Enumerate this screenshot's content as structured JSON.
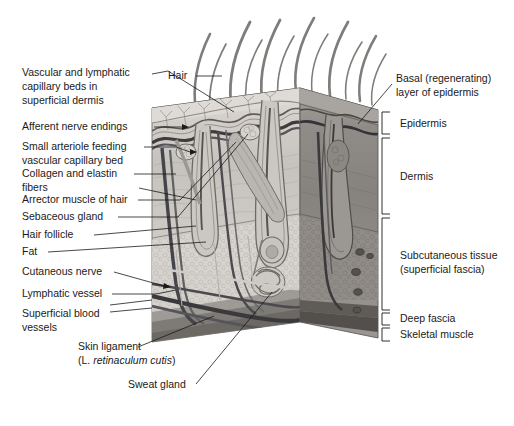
{
  "figure": {
    "background": "#ffffff",
    "ink": "#1a1a1a"
  },
  "left_labels": [
    {
      "id": "vascular-lymphatic",
      "lines": [
        "Vascular and lymphatic",
        "capillary beds in",
        "superficial dermis"
      ],
      "x": 22,
      "y": 76
    },
    {
      "id": "afferent-nerve-endings",
      "lines": [
        "Afferent nerve endings"
      ],
      "x": 22,
      "y": 130
    },
    {
      "id": "small-arteriole",
      "lines": [
        "Small arteriole feeding",
        "vascular capillary bed"
      ],
      "x": 22,
      "y": 150
    },
    {
      "id": "collagen-elastin",
      "lines": [
        "Collagen and elastin",
        "fibers"
      ],
      "x": 22,
      "y": 177
    },
    {
      "id": "arrector-muscle",
      "lines": [
        "Arrector muscle of hair"
      ],
      "x": 22,
      "y": 203
    },
    {
      "id": "sebaceous-gland",
      "lines": [
        "Sebaceous gland"
      ],
      "x": 22,
      "y": 220
    },
    {
      "id": "hair-follicle",
      "lines": [
        "Hair follicle"
      ],
      "x": 22,
      "y": 238
    },
    {
      "id": "fat",
      "lines": [
        "Fat"
      ],
      "x": 22,
      "y": 255
    },
    {
      "id": "cutaneous-nerve",
      "lines": [
        "Cutaneous nerve"
      ],
      "x": 22,
      "y": 275
    },
    {
      "id": "lymphatic-vessel",
      "lines": [
        "Lymphatic vessel"
      ],
      "x": 22,
      "y": 297
    },
    {
      "id": "superficial-blood-vessels",
      "lines": [
        "Superficial blood",
        "vessels"
      ],
      "x": 22,
      "y": 317
    }
  ],
  "bottom_labels": {
    "skin_ligament": {
      "lines": [
        "Skin ligament"
      ],
      "x": 78,
      "y": 350
    },
    "skin_ligament_latin_prefix": "(L. ",
    "skin_ligament_latin_italic": "retinaculum cutis",
    "skin_ligament_latin_suffix": ")",
    "skin_ligament_latin_x": 78,
    "skin_ligament_latin_y": 364,
    "sweat_gland": {
      "lines": [
        "Sweat gland"
      ],
      "x": 128,
      "y": 388
    }
  },
  "top_labels": {
    "hair": {
      "text": "Hair",
      "x": 168,
      "y": 79
    }
  },
  "right_labels": [
    {
      "id": "basal-layer",
      "lines": [
        "Basal (regenerating)",
        "layer of epidermis"
      ],
      "x": 396,
      "y": 82
    },
    {
      "id": "epidermis",
      "lines": [
        "Epidermis"
      ],
      "x": 400,
      "y": 124
    },
    {
      "id": "dermis",
      "lines": [
        "Dermis"
      ],
      "x": 400,
      "y": 179
    },
    {
      "id": "subcutaneous",
      "lines": [
        "Subcutaneous tissue",
        "(superficial fascia)"
      ],
      "x": 400,
      "y": 259
    },
    {
      "id": "deep-fascia",
      "lines": [
        "Deep fascia"
      ],
      "x": 400,
      "y": 320
    },
    {
      "id": "skeletal-muscle",
      "lines": [
        "Skeletal muscle"
      ],
      "x": 400,
      "y": 335
    }
  ],
  "brackets": [
    {
      "id": "bracket-epidermis",
      "x": 382,
      "top": 112,
      "bottom": 134
    },
    {
      "id": "bracket-dermis",
      "x": 382,
      "top": 138,
      "bottom": 214
    },
    {
      "id": "bracket-subcutaneous",
      "x": 382,
      "top": 218,
      "bottom": 310
    },
    {
      "id": "bracket-deep-fascia",
      "x": 382,
      "top": 313,
      "bottom": 325
    },
    {
      "id": "bracket-skeletal-muscle",
      "x": 382,
      "top": 328,
      "bottom": 341
    }
  ],
  "colors": {
    "epidermis_top": "#d8d5d0",
    "epidermis_band": "#c9c5c0",
    "dermis_left": "#b4b0ac",
    "dermis_front": "#bfbbb6",
    "dermis_right": "#8e8a86",
    "subcutis": "#d2cfca",
    "fascia": "#8a8783",
    "muscle": "#6f6c68",
    "vessel_dark": "#3a3a3c",
    "vessel_mid": "#5c5c5e",
    "hair_shaft": "#7a7874",
    "outline": "#5a5855"
  }
}
